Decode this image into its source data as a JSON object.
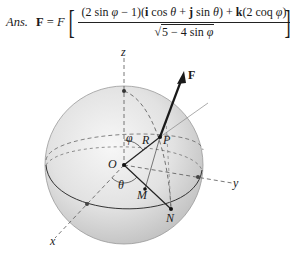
{
  "answer": {
    "label": "Ans.",
    "lhs_vector": "F",
    "equals": " = ",
    "scalar": "F",
    "numerator": "(2 sin φ − 1)(i cos θ + j sin θ) + k(2 coq φ)",
    "numerator_parts": {
      "p1": "(2 sin ",
      "phi1": "φ",
      "p2": " − 1)(",
      "i": "i",
      "p3": " cos ",
      "theta1": "θ",
      "p4": " + ",
      "j": "j",
      "p5": " sin ",
      "theta2": "θ",
      "p6": ") + ",
      "k": "k",
      "p7": "(2 coq ",
      "phi2": "φ",
      "p8": ")"
    },
    "denominator": {
      "radical": "√",
      "expr_a": "5 − 4 sin ",
      "phi": "φ"
    },
    "left_bracket": "[",
    "right_bracket": "]"
  },
  "diagram": {
    "axes": {
      "x": "x",
      "y": "y",
      "z": "z"
    },
    "points": {
      "origin": "O",
      "P": "P",
      "M": "M",
      "N": "N"
    },
    "lengths": {
      "radius": "R"
    },
    "angles": {
      "polar": "φ",
      "azimuth": "θ"
    },
    "force": "F",
    "colors": {
      "sphere_light": "#f2f2f2",
      "sphere_dark": "#c4c4c4",
      "line": "#2a2a2a",
      "dashed": "#555555"
    }
  }
}
